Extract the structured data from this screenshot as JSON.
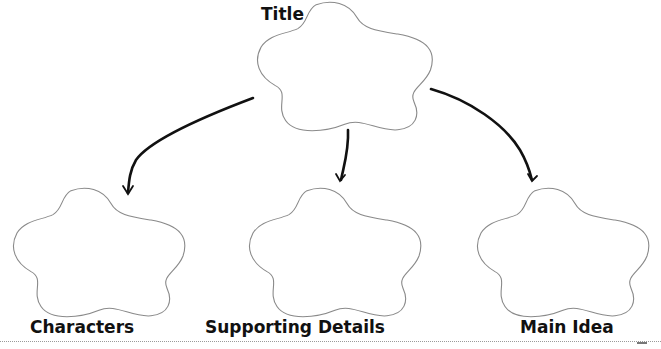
{
  "diagram": {
    "type": "graphic-organizer",
    "title_label": "Title",
    "nodes": [
      {
        "id": "title",
        "label": "Title",
        "shape": "flower-cloud"
      },
      {
        "id": "characters",
        "label": "Characters",
        "shape": "flower-cloud"
      },
      {
        "id": "supporting-details",
        "label": "Supporting Details",
        "shape": "flower-cloud"
      },
      {
        "id": "main-idea",
        "label": "Main Idea",
        "shape": "flower-cloud"
      }
    ],
    "edges": [
      {
        "from": "title",
        "to": "characters"
      },
      {
        "from": "title",
        "to": "supporting-details"
      },
      {
        "from": "title",
        "to": "main-idea"
      }
    ]
  },
  "colors": {
    "outline": "#8a8a8a",
    "arrow": "#111111",
    "text": "#111111"
  }
}
